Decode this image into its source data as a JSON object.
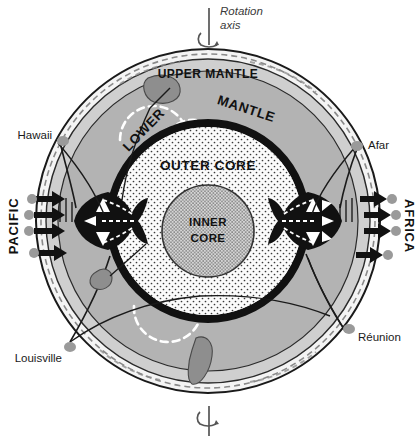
{
  "figure": {
    "type": "cross-section-diagram",
    "width": 417,
    "height": 442
  },
  "axis": {
    "label_line1": "Rotation",
    "label_line2": "axis",
    "top_symbol": "rotation-arrow",
    "bottom_symbol": "rotation-arrow"
  },
  "layers": [
    {
      "id": "upper_mantle",
      "label": "UPPER MANTLE",
      "color": "#cfcfcf"
    },
    {
      "id": "lower_mantle",
      "label_part1": "LOWER",
      "label_part2": "MANTLE",
      "color": "#b3b3b3"
    },
    {
      "id": "outer_core",
      "label": "OUTER CORE",
      "color": "#f2f2f2",
      "texture": "stipple"
    },
    {
      "id": "inner_core",
      "label_line1": "INNER",
      "label_line2": "CORE",
      "color": "#cdcdcd",
      "texture": "stipple-dense"
    }
  ],
  "layer_labels": {
    "upper_mantle": "UPPER MANTLE",
    "lower": "LOWER",
    "mantle": "MANTLE",
    "outer_core": "OUTER CORE",
    "inner_core_line1": "INNER",
    "inner_core_line2": "CORE"
  },
  "region_labels": {
    "left_ocean": "PACIFIC",
    "right_ocean": "AFRICA"
  },
  "hotspots": [
    {
      "name": "Hawaii",
      "side": "left-upper"
    },
    {
      "name": "Afar",
      "side": "right-upper"
    },
    {
      "name": "Louisville",
      "side": "left-lower"
    },
    {
      "name": "Réunion",
      "side": "right-lower"
    }
  ],
  "hotspot_labels": {
    "hawaii": "Hawaii",
    "afar": "Afar",
    "louisville": "Louisville",
    "reunion": "Réunion"
  },
  "colors": {
    "background": "#ffffff",
    "outline": "#1a1a1a",
    "crust_band": "#f4f4f4",
    "lithosphere_band": "#c8c8c8",
    "upper_mantle": "#cfcfcf",
    "lower_mantle": "#b3b3b3",
    "core_boundary": "#111111",
    "outer_core_fill": "#fafafa",
    "inner_core_fill": "#d0d0d0",
    "superplume": "#111111",
    "slab": "#8e8e8e",
    "flow_arrow": "#ffffff",
    "surface_dot": "#9a9a9a",
    "text": "#1a1a1a"
  },
  "features": {
    "superplume_left": "Pacific superplume",
    "superplume_right": "African superplume",
    "slab_top": "subducted slab",
    "slab_bottom_left": "subducted slab",
    "slab_bottom_center": "subducted slab",
    "white_dashed_arrows": "mantle convection flow",
    "black_arrows": "plate motion / subduction",
    "plume_conduits": "narrow plume conduits to hotspots"
  }
}
